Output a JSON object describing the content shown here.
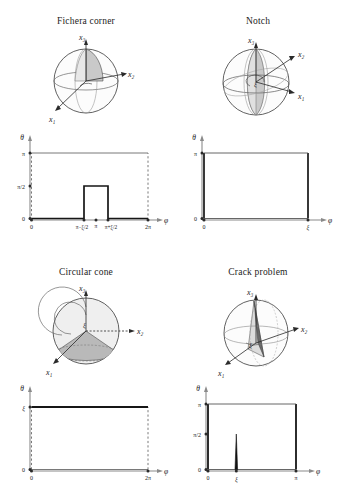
{
  "figure": {
    "caption_present": false,
    "panel_count": 4
  },
  "panels": [
    {
      "id": "fichera-corner",
      "title": "Fichera corner",
      "axes3d": {
        "x1": "x₁",
        "x2": "x₂",
        "x3": "x₃",
        "angle": "ξ"
      },
      "plot": {
        "ylabel": "θ",
        "xlabel": "φ",
        "yticks": [
          "0",
          "π/2",
          "π"
        ],
        "ytick_values": [
          0,
          1.5707963,
          3.1415927
        ],
        "xticks": [
          "0",
          "π−ξ/2",
          "π",
          "π+ξ/2",
          "2π"
        ],
        "xtick_values": [
          0,
          2.5,
          3.1415927,
          3.78,
          6.2831853
        ],
        "xlim": [
          0,
          6.2831853
        ],
        "ylim": [
          0,
          3.1415927
        ],
        "upper_boundary_style": "solid-thin",
        "side_boundary_style": "dashed",
        "description": "lower boundary is 0 except a raised plateau of height π/2 between π−ξ/2 and π+ξ/2; top boundary at π"
      }
    },
    {
      "id": "notch",
      "title": "Notch",
      "axes3d": {
        "x1": "x₁",
        "x2": "x₂",
        "x3": "x₃",
        "angle": "ξ"
      },
      "plot": {
        "ylabel": "θ",
        "xlabel": "φ",
        "yticks": [
          "0",
          "π"
        ],
        "ytick_values": [
          0,
          3.1415927
        ],
        "xticks": [
          "0",
          "ξ"
        ],
        "xtick_values": [
          0,
          5.0
        ],
        "xlim": [
          0,
          6.2831853
        ],
        "ylim": [
          0,
          3.1415927
        ],
        "upper_boundary_style": "solid-thin",
        "side_boundary_style": "solid-thick",
        "description": "full rectangle 0≤φ≤ξ, 0≤θ≤π with solid vertical edges"
      }
    },
    {
      "id": "circular-cone",
      "title": "Circular cone",
      "axes3d": {
        "x1": "x₁",
        "x2": "x₂",
        "x3": "x₃",
        "angle": "ξ"
      },
      "plot": {
        "ylabel": "θ",
        "xlabel": "φ",
        "yticks": [
          "0",
          "ξ"
        ],
        "ytick_values": [
          0,
          2.62
        ],
        "xticks": [
          "0",
          "2π"
        ],
        "xtick_values": [
          0,
          6.2831853
        ],
        "xlim": [
          0,
          6.2831853
        ],
        "ylim": [
          0,
          3.1415927
        ],
        "upper_boundary_style": "solid-thick",
        "side_boundary_style": "dashed",
        "description": "horizontal solid line at θ=ξ across full φ range 0 to 2π; dashed vertical sides"
      }
    },
    {
      "id": "crack-problem",
      "title": "Crack problem",
      "axes3d": {
        "x1": "x₁",
        "x2": "x₂",
        "x3": "x₃",
        "angle": "ξ"
      },
      "plot": {
        "ylabel": "θ",
        "xlabel": "φ",
        "yticks": [
          "0",
          "π/2",
          "π"
        ],
        "ytick_values": [
          0,
          1.5707963,
          3.1415927
        ],
        "xticks": [
          "0",
          "ξ",
          "π"
        ],
        "xtick_values": [
          0,
          1.15,
          3.1415927
        ],
        "xlim": [
          0,
          3.6
        ],
        "ylim": [
          0,
          3.1415927
        ],
        "upper_boundary_style": "solid-thin",
        "side_boundary_style": "solid-thick",
        "description": "rectangle 0≤φ≤π height π with a narrow spike of height π/2 located at φ=ξ"
      }
    }
  ],
  "style": {
    "axis_color": "#8a8a8a",
    "curve_color": "#1a1a1a",
    "dash_color": "#9a9a9a",
    "sphere_outline": "#3a3a3a",
    "sphere_fill_light": "#f0f0f0",
    "sphere_fill_mid": "#d8d8d8",
    "sphere_fill_dark": "#b8b8b8",
    "background": "#ffffff"
  }
}
